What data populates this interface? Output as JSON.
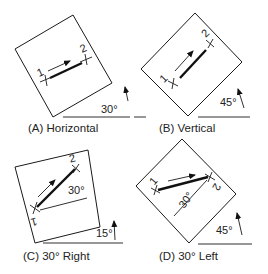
{
  "panels": [
    {
      "id": "A",
      "caption": "(A) Horizontal",
      "board_angle": "30°",
      "point1": "1",
      "point2": "2"
    },
    {
      "id": "B",
      "caption": "(B) Vertical",
      "board_angle": "45°",
      "point1": "1",
      "point2": "2"
    },
    {
      "id": "C",
      "caption": "(C) 30° Right",
      "board_angle": "15°",
      "line_angle": "30°",
      "point1": "1",
      "point2": "2"
    },
    {
      "id": "D",
      "caption": "(D) 30° Left",
      "board_angle": "45°",
      "line_angle": "30°",
      "point1": "1",
      "point2": "2"
    }
  ],
  "colors": {
    "stroke": "#1a1a1a",
    "background": "#ffffff"
  }
}
